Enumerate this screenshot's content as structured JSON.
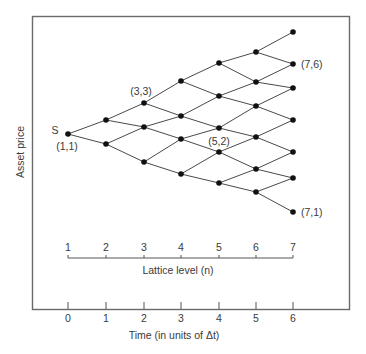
{
  "figure": {
    "y_axis_label": "Asset price",
    "start_label": "S",
    "annotations": [
      {
        "id": "n1_1",
        "text": "(1,1)"
      },
      {
        "id": "n3_3",
        "text": "(3,3)"
      },
      {
        "id": "n5_2",
        "text": "(5,2)"
      },
      {
        "id": "n7_6",
        "text": "(7,6)"
      },
      {
        "id": "n7_1",
        "text": "(7,1)"
      }
    ],
    "lattice_axis": {
      "label": "Lattice level (n)",
      "ticks": [
        "1",
        "2",
        "3",
        "4",
        "5",
        "6",
        "7"
      ]
    },
    "time_axis": {
      "label": "Time (in units of Δt)",
      "ticks": [
        "0",
        "1",
        "2",
        "3",
        "4",
        "5",
        "6"
      ]
    },
    "lattice": {
      "levels": [
        {
          "level": 1,
          "x": 68,
          "ys": [
            134
          ]
        },
        {
          "level": 2,
          "x": 106,
          "ys": [
            120,
            144
          ]
        },
        {
          "level": 3,
          "x": 144,
          "ys": [
            103,
            127,
            162
          ]
        },
        {
          "level": 4,
          "x": 181,
          "ys": [
            81,
            116,
            139,
            174
          ]
        },
        {
          "level": 5,
          "x": 219,
          "ys": [
            63,
            96,
            128,
            152,
            183
          ]
        },
        {
          "level": 6,
          "x": 256,
          "ys": [
            52,
            82,
            106,
            137,
            169,
            192
          ]
        },
        {
          "level": 7,
          "x": 293,
          "ys": [
            32,
            64,
            88,
            120,
            152,
            178,
            212
          ]
        }
      ]
    },
    "colors": {
      "node": "#111111",
      "edge": "#4a4a4a",
      "frame": "#6a6a6a",
      "text": "#3a3a3a"
    }
  }
}
